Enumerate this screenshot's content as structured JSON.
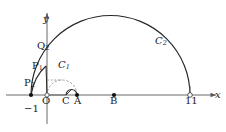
{
  "figure": {
    "axes": {
      "x_label": "x",
      "y_label": "y",
      "axis_color": "#555555"
    },
    "labels": {
      "origin": "O",
      "point_minus_one": "−1",
      "point_C": "C",
      "point_A": "A",
      "point_B": "B",
      "point_eleven": "11",
      "point_P1_base": "P",
      "point_P1_sub": "1",
      "point_P2_base": "P",
      "point_P2_sub": "2",
      "point_Q2_base": "Q",
      "point_Q2_sub": "2",
      "curve_C1_base": "C",
      "curve_C1_sub": "1",
      "curve_C2_base": "C",
      "curve_C2_sub": "2"
    },
    "colors": {
      "curve": "#262626",
      "dashed": "#707070",
      "axis": "#585858",
      "text": "#1a1a1a",
      "marker_fill": "#111111",
      "open_marker_fill": "#ffffff"
    },
    "markers": [
      {
        "name": "P2",
        "x": -1,
        "filled": true
      },
      {
        "name": "O",
        "x": 0,
        "filled": false
      },
      {
        "name": "A",
        "x": 2,
        "filled": true
      },
      {
        "name": "B",
        "x": 5,
        "filled": true
      },
      {
        "name": "eleven",
        "x": 11,
        "filled": false
      }
    ],
    "curves": [
      {
        "name": "C2",
        "type": "semicircle",
        "from": -1,
        "to": 11,
        "style": "solid"
      },
      {
        "name": "C1",
        "type": "semicircle",
        "from": 0,
        "to": 2,
        "style": "dashed"
      },
      {
        "name": "small-arc",
        "type": "semicircle",
        "from": 1,
        "to": 2,
        "style": "solid"
      },
      {
        "name": "P-spiral",
        "type": "arc",
        "from": -1,
        "through": "P1",
        "to": "Q2",
        "style": "solid"
      }
    ]
  }
}
